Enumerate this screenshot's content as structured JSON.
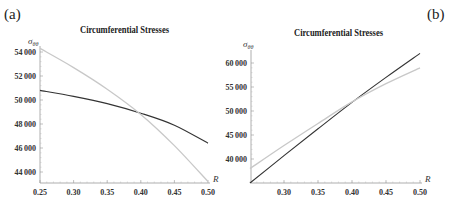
{
  "panels": {
    "a": {
      "label": "(a)",
      "title": "Circumferential   Stresses",
      "ylabel": "σθθ",
      "xlabel": "R"
    },
    "b": {
      "label": "(b)",
      "title": "Circumferential   Stresses",
      "ylabel": "σθθ",
      "xlabel": "R"
    }
  },
  "chart_data": [
    {
      "type": "line",
      "title": "Circumferential Stresses",
      "panel": "(a)",
      "xlabel": "R",
      "ylabel": "σθθ",
      "xlim": [
        0.25,
        0.5
      ],
      "ylim": [
        43200,
        54500
      ],
      "xticks": [
        0.25,
        0.3,
        0.35,
        0.4,
        0.45,
        0.5
      ],
      "yticks": [
        44000,
        46000,
        48000,
        50000,
        52000,
        54000
      ],
      "grid": false,
      "series": [
        {
          "name": "dark",
          "color": "#333333",
          "x": [
            0.25,
            0.3,
            0.35,
            0.4,
            0.45,
            0.5
          ],
          "y": [
            50800,
            50300,
            49700,
            48900,
            47900,
            46400
          ]
        },
        {
          "name": "light",
          "color": "#c8c8c8",
          "x": [
            0.25,
            0.3,
            0.35,
            0.4,
            0.45,
            0.5
          ],
          "y": [
            54300,
            52700,
            50900,
            48800,
            46200,
            43200
          ]
        }
      ]
    },
    {
      "type": "line",
      "title": "Circumferential Stresses",
      "panel": "(b)",
      "xlabel": "R",
      "ylabel": "σθθ",
      "xlim": [
        0.25,
        0.5
      ],
      "ylim": [
        35000,
        62500
      ],
      "xticks": [
        0.3,
        0.35,
        0.4,
        0.45,
        0.5
      ],
      "yticks": [
        40000,
        45000,
        50000,
        55000,
        60000
      ],
      "grid": false,
      "series": [
        {
          "name": "dark",
          "color": "#333333",
          "x": [
            0.25,
            0.3,
            0.35,
            0.4,
            0.45,
            0.5
          ],
          "y": [
            35000,
            40700,
            46300,
            51800,
            57000,
            62000
          ]
        },
        {
          "name": "light",
          "color": "#c8c8c8",
          "x": [
            0.25,
            0.3,
            0.35,
            0.4,
            0.45,
            0.5
          ],
          "y": [
            38000,
            42800,
            47400,
            51900,
            55700,
            59000
          ]
        }
      ]
    }
  ]
}
